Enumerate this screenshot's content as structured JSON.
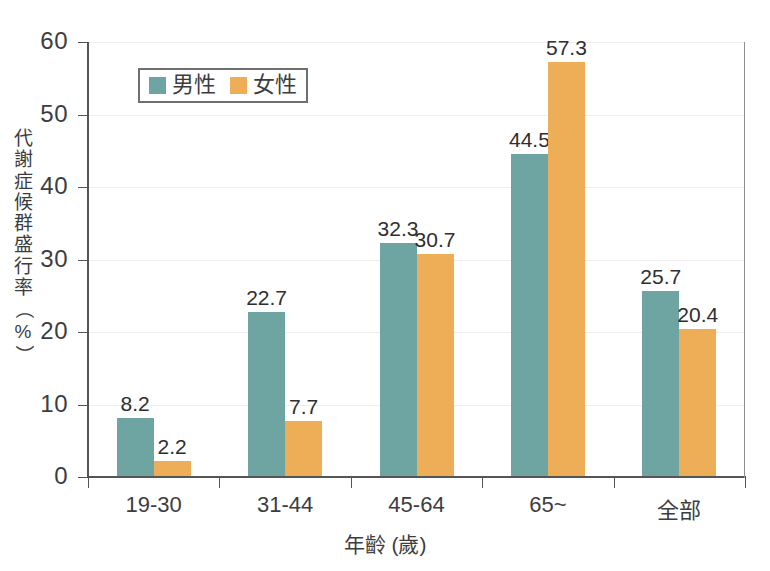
{
  "chart_data": {
    "type": "bar",
    "title": "",
    "xlabel": "年齡 (歲)",
    "ylabel": "代謝症候群盛行率 (%)",
    "categories": [
      "19-30",
      "31-44",
      "45-64",
      "65~",
      "全部"
    ],
    "series": [
      {
        "name": "男性",
        "color": "#6ea5a2",
        "values": [
          8.2,
          22.7,
          32.3,
          44.5,
          25.7
        ]
      },
      {
        "name": "女性",
        "color": "#eeae58",
        "values": [
          2.2,
          7.7,
          30.7,
          57.3,
          20.4
        ]
      }
    ],
    "ylim": [
      0,
      60
    ],
    "yticks": [
      0,
      10,
      20,
      30,
      40,
      50,
      60
    ],
    "ytick_labels": [
      "0",
      "10",
      "20",
      "30",
      "40",
      "50",
      "60"
    ],
    "grid": true,
    "legend_position": "upper-left",
    "data_labels": [
      "8.2",
      "2.2",
      "22.7",
      "7.7",
      "32.3",
      "30.7",
      "44.5",
      "57.3",
      "25.7",
      "20.4"
    ]
  },
  "axis": {
    "y_title_chars": [
      "代",
      "謝",
      "症",
      "候",
      "群",
      "盛",
      "行",
      "率"
    ],
    "y_title_percent": "%",
    "x_title": "年齡 (歲)"
  },
  "legend": {
    "male_label": "男性",
    "female_label": "女性",
    "male_color": "#6ea5a2",
    "female_color": "#eeae58"
  }
}
